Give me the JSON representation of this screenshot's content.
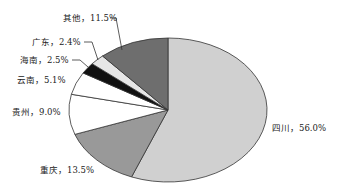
{
  "chart_data": {
    "type": "pie",
    "title": "",
    "start_angle_deg": 90,
    "direction": "clockwise",
    "slices": [
      {
        "label": "四川",
        "value": 56.0,
        "text": "四川，56.0%",
        "color": "#d0d0d0"
      },
      {
        "label": "重庆",
        "value": 13.5,
        "text": "重庆，13.5%",
        "color": "#999999"
      },
      {
        "label": "贵州",
        "value": 9.0,
        "text": "贵州，9.0%",
        "color": "#ffffff"
      },
      {
        "label": "云南",
        "value": 5.1,
        "text": "云南，5.1%",
        "color": "#ffffff"
      },
      {
        "label": "海南",
        "value": 2.5,
        "text": "海南，2.5%",
        "color": "#111111"
      },
      {
        "label": "广东",
        "value": 2.4,
        "text": "广东，2.4%",
        "color": "#e6e6e6"
      },
      {
        "label": "其他",
        "value": 11.5,
        "text": "其他，11.5%",
        "color": "#6e6e6e"
      }
    ],
    "categories": [
      "四川",
      "重庆",
      "贵州",
      "云南",
      "海南",
      "广东",
      "其他"
    ],
    "values": [
      56.0,
      13.5,
      9.0,
      5.1,
      2.5,
      2.4,
      11.5
    ],
    "legend": "none",
    "data_labels": true
  }
}
